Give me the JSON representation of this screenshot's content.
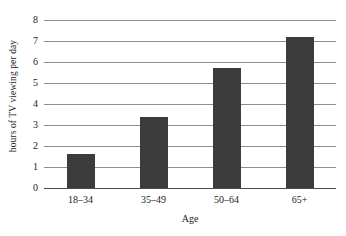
{
  "chart_data": {
    "type": "bar",
    "title": "",
    "subtitle": "",
    "categories": [
      "18–34",
      "35–49",
      "50–64",
      "65+"
    ],
    "values": [
      1.6,
      3.4,
      5.7,
      7.2
    ],
    "xlabel": "Age",
    "ylabel": "hours of TV viewing per day",
    "ylim": [
      0,
      8
    ],
    "yticks": [
      "0",
      "1",
      "2",
      "3",
      "4",
      "5",
      "6",
      "7",
      "8"
    ],
    "ytick_values": [
      0,
      1,
      2,
      3,
      4,
      5,
      6,
      7,
      8
    ],
    "grid": "horizontal",
    "legend": "none",
    "bar_color": "#3b3b3b",
    "gridline_color": "#8d8d8d",
    "axis_color": "#4a4a4a",
    "background_color": "#ffffff"
  }
}
